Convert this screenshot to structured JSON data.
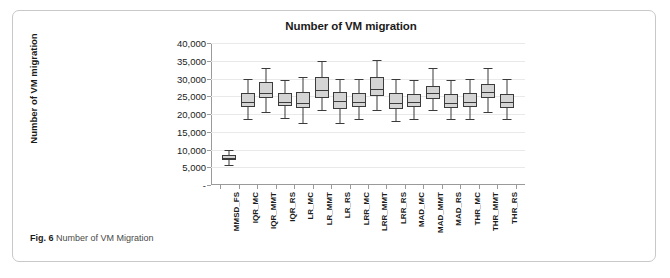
{
  "caption": {
    "label": "Fig. 6",
    "text": "Number of VM Migration"
  },
  "chart_data": {
    "type": "box",
    "title": "Number of VM migration",
    "xlabel": "",
    "ylabel": "Number of VM migration",
    "ylim": [
      0,
      40000
    ],
    "yticks": [
      0,
      5000,
      10000,
      15000,
      20000,
      25000,
      30000,
      35000,
      40000
    ],
    "ytick_labels": [
      "-",
      "5,000",
      "10,000",
      "15,000",
      "20,000",
      "25,000",
      "30,000",
      "35,000",
      "40,000"
    ],
    "grid": true,
    "legend": "none",
    "categories": [
      "MMSD_FS",
      "IQR_MC",
      "IQR_MMT",
      "IQR_RS",
      "LR_MC",
      "LR_MMT",
      "LR_RS",
      "LRR_MC",
      "LRR_MMT",
      "LRR_RS",
      "MAD_MC",
      "MAD_MMT",
      "MAD_RS",
      "THR_MC",
      "THR_MMT",
      "THR_RS"
    ],
    "boxes": [
      {
        "category": "MMSD_FS",
        "min": 5500,
        "q1": 7000,
        "median": 7600,
        "q3": 8500,
        "max": 10000
      },
      {
        "category": "IQR_MC",
        "min": 18500,
        "q1": 22000,
        "median": 23300,
        "q3": 26000,
        "max": 30000
      },
      {
        "category": "IQR_MMT",
        "min": 20500,
        "q1": 24500,
        "median": 25800,
        "q3": 29000,
        "max": 33000
      },
      {
        "category": "IQR_RS",
        "min": 19000,
        "q1": 22200,
        "median": 23400,
        "q3": 26000,
        "max": 29500
      },
      {
        "category": "LR_MC",
        "min": 17500,
        "q1": 21800,
        "median": 23200,
        "q3": 26200,
        "max": 30500
      },
      {
        "category": "LR_MMT",
        "min": 21000,
        "q1": 24500,
        "median": 26700,
        "q3": 30500,
        "max": 35000
      },
      {
        "category": "LR_RS",
        "min": 17500,
        "q1": 21500,
        "median": 23800,
        "q3": 26300,
        "max": 30000
      },
      {
        "category": "LRR_MC",
        "min": 18500,
        "q1": 22000,
        "median": 23500,
        "q3": 26000,
        "max": 30000
      },
      {
        "category": "LRR_MMT",
        "min": 21000,
        "q1": 25000,
        "median": 27000,
        "q3": 30500,
        "max": 35200
      },
      {
        "category": "LRR_RS",
        "min": 18000,
        "q1": 21500,
        "median": 23000,
        "q3": 25800,
        "max": 30000
      },
      {
        "category": "MAD_MC",
        "min": 18500,
        "q1": 22000,
        "median": 23300,
        "q3": 25500,
        "max": 29500
      },
      {
        "category": "MAD_MMT",
        "min": 21000,
        "q1": 24200,
        "median": 25800,
        "q3": 28000,
        "max": 33000
      },
      {
        "category": "MAD_RS",
        "min": 18500,
        "q1": 21800,
        "median": 23200,
        "q3": 25500,
        "max": 29500
      },
      {
        "category": "THR_MC",
        "min": 18500,
        "q1": 22000,
        "median": 23400,
        "q3": 25800,
        "max": 30000
      },
      {
        "category": "THR_MMT",
        "min": 20500,
        "q1": 24500,
        "median": 26200,
        "q3": 28500,
        "max": 33000
      },
      {
        "category": "THR_RS",
        "min": 18500,
        "q1": 21800,
        "median": 23300,
        "q3": 25500,
        "max": 30000
      }
    ]
  },
  "colors": {
    "box_fill": "#d4d4d4",
    "box_stroke": "#3b3b3b",
    "grid": "#e9e9e9",
    "axis": "#9a9a9a",
    "text": "#1b1b1b",
    "card_border": "#c8c8c8"
  }
}
